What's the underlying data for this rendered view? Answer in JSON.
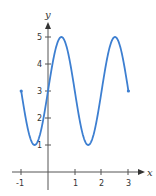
{
  "chart_data": {
    "type": "line",
    "title": "",
    "xlabel": "x",
    "ylabel": "y",
    "xlim": [
      -1,
      3
    ],
    "ylim": [
      0,
      5
    ],
    "grid": false,
    "x_ticks": [
      "-1",
      "1",
      "2",
      "3"
    ],
    "y_ticks": [
      "1",
      "2",
      "3",
      "4",
      "5"
    ],
    "series": [
      {
        "name": "curve",
        "color": "#3d7fd1",
        "x": [
          -1,
          -0.5,
          0,
          0.5,
          1,
          1.5,
          2,
          2.5,
          3
        ],
        "values": [
          3,
          1,
          3,
          5,
          3,
          1,
          3,
          5,
          3
        ],
        "endpoints": "closed-dots"
      }
    ]
  },
  "colors": {
    "axis": "#555555",
    "curve": "#3d7fd1"
  }
}
